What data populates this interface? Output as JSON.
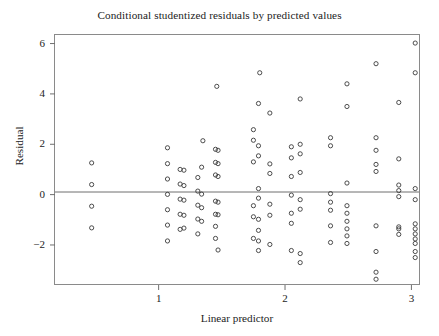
{
  "chart_data": {
    "type": "scatter",
    "title": "Conditional studentized residuals by predicted values",
    "xlabel": "Linear predictor",
    "ylabel": "Residual",
    "xlim": [
      0.18,
      3.06
    ],
    "ylim": [
      -3.55,
      6.34
    ],
    "xticks": [
      1,
      2,
      3
    ],
    "xtick_labels": [
      "1",
      "2",
      "3"
    ],
    "yticks": [
      6,
      4,
      2,
      0,
      -2
    ],
    "ytick_labels": [
      "6",
      "4",
      "2",
      "0",
      "−2"
    ],
    "grid": false,
    "legend": null,
    "annotations": [
      {
        "type": "reference-line",
        "axis": "y",
        "value": 0
      }
    ],
    "marker": {
      "shape": "open-circle",
      "radius": 2.1,
      "stroke": "#3a3a3a",
      "fill": "none"
    },
    "points": [
      [
        0.47,
        1.26
      ],
      [
        0.47,
        0.4
      ],
      [
        0.47,
        -0.46
      ],
      [
        0.47,
        -1.32
      ],
      [
        1.07,
        1.86
      ],
      [
        1.07,
        1.23
      ],
      [
        1.07,
        0.62
      ],
      [
        1.07,
        0.01
      ],
      [
        1.07,
        -0.6
      ],
      [
        1.07,
        -1.21
      ],
      [
        1.07,
        -1.84
      ],
      [
        1.17,
        1.0
      ],
      [
        1.17,
        0.42
      ],
      [
        1.17,
        -0.18
      ],
      [
        1.17,
        -0.78
      ],
      [
        1.17,
        -1.38
      ],
      [
        1.2,
        0.97
      ],
      [
        1.2,
        0.36
      ],
      [
        1.2,
        -0.22
      ],
      [
        1.2,
        -0.82
      ],
      [
        1.2,
        -1.33
      ],
      [
        1.31,
        0.68
      ],
      [
        1.31,
        0.14
      ],
      [
        1.31,
        -0.42
      ],
      [
        1.31,
        -0.97
      ],
      [
        1.31,
        -1.56
      ],
      [
        1.34,
        1.09
      ],
      [
        1.34,
        0.02
      ],
      [
        1.34,
        -0.52
      ],
      [
        1.34,
        -1.06
      ],
      [
        1.35,
        2.14
      ],
      [
        1.45,
        1.8
      ],
      [
        1.45,
        1.28
      ],
      [
        1.45,
        0.78
      ],
      [
        1.45,
        -0.26
      ],
      [
        1.45,
        -0.78
      ],
      [
        1.45,
        -1.26
      ],
      [
        1.45,
        -1.74
      ],
      [
        1.47,
        1.76
      ],
      [
        1.47,
        1.23
      ],
      [
        1.47,
        0.72
      ],
      [
        1.47,
        -0.3
      ],
      [
        1.47,
        -0.8
      ],
      [
        1.47,
        -2.2
      ],
      [
        1.46,
        4.3
      ],
      [
        1.75,
        2.58
      ],
      [
        1.75,
        2.16
      ],
      [
        1.75,
        1.3
      ],
      [
        1.75,
        -0.44
      ],
      [
        1.75,
        -0.88
      ],
      [
        1.75,
        -1.74
      ],
      [
        1.79,
        3.62
      ],
      [
        1.79,
        1.94
      ],
      [
        1.79,
        1.54
      ],
      [
        1.79,
        0.24
      ],
      [
        1.79,
        -0.14
      ],
      [
        1.79,
        -0.98
      ],
      [
        1.79,
        -1.42
      ],
      [
        1.79,
        -1.84
      ],
      [
        1.79,
        -2.22
      ],
      [
        1.8,
        4.84
      ],
      [
        1.88,
        3.24
      ],
      [
        1.88,
        1.22
      ],
      [
        1.88,
        0.84
      ],
      [
        1.88,
        -0.38
      ],
      [
        1.88,
        -0.82
      ],
      [
        1.88,
        -1.98
      ],
      [
        2.05,
        1.9
      ],
      [
        2.05,
        1.46
      ],
      [
        2.05,
        0.72
      ],
      [
        2.05,
        -0.02
      ],
      [
        2.05,
        -0.74
      ],
      [
        2.05,
        -1.14
      ],
      [
        2.05,
        -2.22
      ],
      [
        2.12,
        3.8
      ],
      [
        2.12,
        2.0
      ],
      [
        2.12,
        1.62
      ],
      [
        2.12,
        0.88
      ],
      [
        2.12,
        -0.2
      ],
      [
        2.12,
        -0.58
      ],
      [
        2.12,
        -2.34
      ],
      [
        2.12,
        -2.7
      ],
      [
        2.36,
        2.26
      ],
      [
        2.36,
        1.94
      ],
      [
        2.36,
        0.04
      ],
      [
        2.36,
        -0.3
      ],
      [
        2.36,
        -0.62
      ],
      [
        2.36,
        -1.24
      ],
      [
        2.36,
        -1.9
      ],
      [
        2.49,
        4.4
      ],
      [
        2.49,
        3.5
      ],
      [
        2.49,
        0.46
      ],
      [
        2.49,
        -0.44
      ],
      [
        2.49,
        -0.74
      ],
      [
        2.49,
        -1.06
      ],
      [
        2.49,
        -1.36
      ],
      [
        2.49,
        -1.64
      ],
      [
        2.49,
        -1.94
      ],
      [
        2.72,
        5.2
      ],
      [
        2.72,
        2.26
      ],
      [
        2.72,
        1.76
      ],
      [
        2.72,
        1.2
      ],
      [
        2.72,
        0.92
      ],
      [
        2.72,
        -1.24
      ],
      [
        2.72,
        -2.26
      ],
      [
        2.72,
        -3.08
      ],
      [
        2.72,
        -3.36
      ],
      [
        2.9,
        3.66
      ],
      [
        2.9,
        1.42
      ],
      [
        2.9,
        0.38
      ],
      [
        2.9,
        0.16
      ],
      [
        2.9,
        -0.08
      ],
      [
        2.9,
        -1.28
      ],
      [
        2.9,
        -1.36
      ],
      [
        2.9,
        -1.58
      ],
      [
        3.03,
        6.02
      ],
      [
        3.03,
        4.84
      ],
      [
        3.03,
        0.24
      ],
      [
        3.03,
        -0.2
      ],
      [
        3.03,
        -1.16
      ],
      [
        3.03,
        -1.36
      ],
      [
        3.03,
        -1.56
      ],
      [
        3.03,
        -1.76
      ],
      [
        3.03,
        -1.94
      ],
      [
        3.03,
        -2.26
      ],
      [
        3.03,
        -2.5
      ]
    ]
  },
  "axes": {
    "title": "Conditional studentized residuals by predicted values",
    "y_title": "Residual",
    "x_title": "Linear predictor",
    "y_tick_labels": [
      "6",
      "4",
      "2",
      "0",
      "−2"
    ],
    "x_tick_labels": [
      "1",
      "2",
      "3"
    ]
  }
}
